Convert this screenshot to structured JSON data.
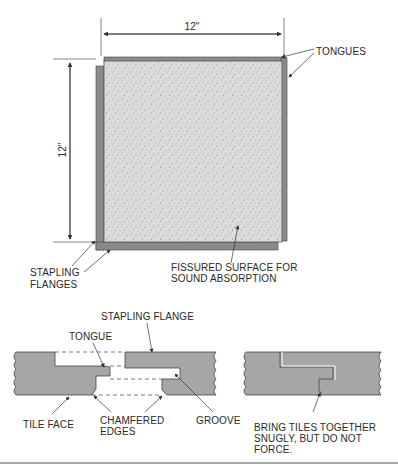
{
  "figure": {
    "top_view": {
      "width_dimension": "12\"",
      "height_dimension": "12\"",
      "labels": {
        "tongues": "TONGUES",
        "stapling_flanges_1": "STAPLING",
        "stapling_flanges_2": "FLANGES",
        "surface_1": "FISSURED SURFACE FOR",
        "surface_2": "SOUND ABSORPTION"
      }
    },
    "section_apart": {
      "labels": {
        "stapling_flange": "STAPLING FLANGE",
        "tongue": "TONGUE",
        "tile_face": "TILE FACE",
        "chamfered_1": "CHAMFERED",
        "chamfered_2": "EDGES",
        "groove": "GROOVE"
      }
    },
    "section_joined": {
      "labels": {
        "note_1": "BRING TILES TOGETHER",
        "note_2": "SNUGLY, BUT DO NOT",
        "note_3": "FORCE."
      }
    },
    "colors": {
      "tile_fill": "#dcdcdc",
      "flange_fill": "#8a8a8a",
      "section_fill": "#a6a6a6",
      "line": "#333333"
    }
  }
}
